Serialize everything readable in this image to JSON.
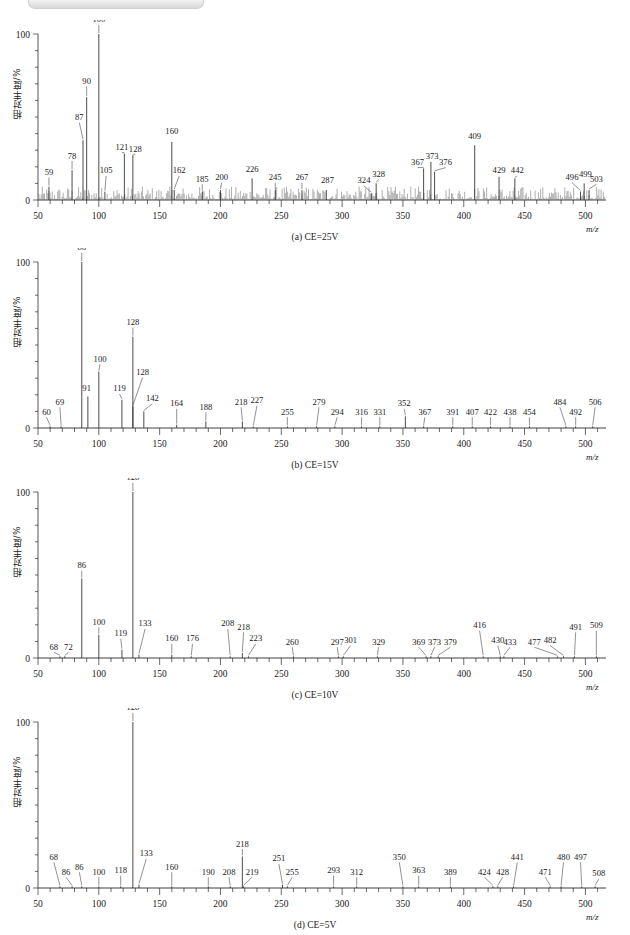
{
  "figure": {
    "title_bar_present": true,
    "axis": {
      "x_min": 50,
      "x_max": 512,
      "y_min": 0,
      "y_max": 100,
      "x_ticks_major": [
        50,
        100,
        150,
        200,
        250,
        300,
        350,
        400,
        450,
        500
      ],
      "y_ticks_major": [
        0,
        100
      ],
      "xlabel": "m/z",
      "ylabel": "相对丰度/%"
    },
    "y_axis_label": "相对丰度/%",
    "x_axis_label": "m/z",
    "y_tick_top": "100",
    "y_tick_bottom": "0"
  },
  "chart_data": [
    {
      "type": "line",
      "id": "panel-a",
      "title": "(a) CE=25V",
      "caption": "(a) CE=25V",
      "xlabel": "m/z",
      "ylabel": "相对丰度/%",
      "xlim": [
        50,
        512
      ],
      "ylim": [
        0,
        100
      ],
      "grid": false,
      "noisy_baseline": true,
      "x_ticks": [
        50,
        100,
        150,
        200,
        250,
        300,
        350,
        400,
        450,
        500
      ],
      "labeled_peaks": [
        {
          "mz": 59,
          "label": "59",
          "intensity": 8,
          "lx": 59,
          "ly": 15
        },
        {
          "mz": 78,
          "label": "78",
          "intensity": 18,
          "lx": 78,
          "ly": 25
        },
        {
          "mz": 87,
          "label": "87",
          "intensity": 36,
          "lx": 84,
          "ly": 48
        },
        {
          "mz": 90,
          "label": "90",
          "intensity": 62,
          "lx": 90,
          "ly": 70
        },
        {
          "mz": 100,
          "label": "100",
          "intensity": 100,
          "lx": 100,
          "ly": 107
        },
        {
          "mz": 105,
          "label": "105",
          "intensity": 5,
          "lx": 106,
          "ly": 16
        },
        {
          "mz": 121,
          "label": "121",
          "intensity": 28,
          "lx": 119,
          "ly": 30
        },
        {
          "mz": 128,
          "label": "128",
          "intensity": 27,
          "lx": 130,
          "ly": 29
        },
        {
          "mz": 160,
          "label": "160",
          "intensity": 35,
          "lx": 160,
          "ly": 40
        },
        {
          "mz": 162,
          "label": "162",
          "intensity": 6,
          "lx": 166,
          "ly": 16
        },
        {
          "mz": 185,
          "label": "185",
          "intensity": 5,
          "lx": 185,
          "ly": 11
        },
        {
          "mz": 200,
          "label": "200",
          "intensity": 6,
          "lx": 201,
          "ly": 12
        },
        {
          "mz": 226,
          "label": "226",
          "intensity": 13,
          "lx": 226,
          "ly": 17
        },
        {
          "mz": 245,
          "label": "245",
          "intensity": 6,
          "lx": 245,
          "ly": 12
        },
        {
          "mz": 267,
          "label": "267",
          "intensity": 6,
          "lx": 267,
          "ly": 12
        },
        {
          "mz": 287,
          "label": "287",
          "intensity": 6,
          "lx": 288,
          "ly": 10
        },
        {
          "mz": 324,
          "label": "324",
          "intensity": 4,
          "lx": 318,
          "ly": 10
        },
        {
          "mz": 328,
          "label": "328",
          "intensity": 10,
          "lx": 330,
          "ly": 14
        },
        {
          "mz": 367,
          "label": "367",
          "intensity": 19,
          "lx": 362,
          "ly": 21
        },
        {
          "mz": 373,
          "label": "373",
          "intensity": 23,
          "lx": 374,
          "ly": 25
        },
        {
          "mz": 376,
          "label": "376",
          "intensity": 17,
          "lx": 385,
          "ly": 21
        },
        {
          "mz": 409,
          "label": "409",
          "intensity": 33,
          "lx": 409,
          "ly": 37
        },
        {
          "mz": 429,
          "label": "429",
          "intensity": 14,
          "lx": 429,
          "ly": 16
        },
        {
          "mz": 442,
          "label": "442",
          "intensity": 13,
          "lx": 444,
          "ly": 16
        },
        {
          "mz": 496,
          "label": "496",
          "intensity": 5,
          "lx": 489,
          "ly": 12
        },
        {
          "mz": 499,
          "label": "499",
          "intensity": 10,
          "lx": 500,
          "ly": 14
        },
        {
          "mz": 503,
          "label": "503",
          "intensity": 6,
          "lx": 509,
          "ly": 11
        }
      ]
    },
    {
      "type": "line",
      "id": "panel-b",
      "title": "(b) CE=15V",
      "caption": "(b) CE=15V",
      "xlabel": "m/z",
      "ylabel": "相对丰度/%",
      "xlim": [
        50,
        512
      ],
      "ylim": [
        0,
        100
      ],
      "grid": false,
      "noisy_baseline": false,
      "x_ticks": [
        50,
        100,
        150,
        200,
        250,
        300,
        350,
        400,
        450,
        500
      ],
      "labeled_peaks": [
        {
          "mz": 60,
          "label": "60",
          "intensity": 1,
          "lx": 57,
          "ly": 8
        },
        {
          "mz": 69,
          "label": "69",
          "intensity": 1,
          "lx": 68,
          "ly": 14
        },
        {
          "mz": 86,
          "label": "86",
          "intensity": 100,
          "lx": 86,
          "ly": 107
        },
        {
          "mz": 91,
          "label": "91",
          "intensity": 19,
          "lx": 90,
          "ly": 22
        },
        {
          "mz": 100,
          "label": "100",
          "intensity": 34,
          "lx": 101,
          "ly": 40
        },
        {
          "mz": 119,
          "label": "119",
          "intensity": 17,
          "lx": 117,
          "ly": 22
        },
        {
          "mz": 128,
          "label": "128",
          "intensity": 55,
          "lx": 128,
          "ly": 62
        },
        {
          "mz": 128,
          "label": "128",
          "intensity": 13,
          "lx": 136,
          "ly": 32
        },
        {
          "mz": 137,
          "label": "142",
          "intensity": 10,
          "lx": 144,
          "ly": 16
        },
        {
          "mz": 164,
          "label": "164",
          "intensity": 2,
          "lx": 164,
          "ly": 13
        },
        {
          "mz": 188,
          "label": "188",
          "intensity": 4,
          "lx": 188,
          "ly": 11
        },
        {
          "mz": 218,
          "label": "218",
          "intensity": 4,
          "lx": 217,
          "ly": 14
        },
        {
          "mz": 227,
          "label": "227",
          "intensity": 1,
          "lx": 230,
          "ly": 15
        },
        {
          "mz": 255,
          "label": "255",
          "intensity": 1,
          "lx": 255,
          "ly": 8
        },
        {
          "mz": 279,
          "label": "279",
          "intensity": 1,
          "lx": 281,
          "ly": 14
        },
        {
          "mz": 294,
          "label": "294",
          "intensity": 1,
          "lx": 296,
          "ly": 8
        },
        {
          "mz": 316,
          "label": "316",
          "intensity": 1,
          "lx": 316,
          "ly": 8
        },
        {
          "mz": 331,
          "label": "331",
          "intensity": 1,
          "lx": 331,
          "ly": 8
        },
        {
          "mz": 352,
          "label": "352",
          "intensity": 7,
          "lx": 351,
          "ly": 13
        },
        {
          "mz": 367,
          "label": "367",
          "intensity": 1,
          "lx": 368,
          "ly": 8
        },
        {
          "mz": 391,
          "label": "391",
          "intensity": 1,
          "lx": 391,
          "ly": 8
        },
        {
          "mz": 407,
          "label": "407",
          "intensity": 1,
          "lx": 407,
          "ly": 8
        },
        {
          "mz": 422,
          "label": "422",
          "intensity": 1,
          "lx": 422,
          "ly": 8
        },
        {
          "mz": 438,
          "label": "438",
          "intensity": 1,
          "lx": 438,
          "ly": 8
        },
        {
          "mz": 454,
          "label": "454",
          "intensity": 1,
          "lx": 454,
          "ly": 8
        },
        {
          "mz": 484,
          "label": "484",
          "intensity": 1,
          "lx": 479,
          "ly": 14
        },
        {
          "mz": 492,
          "label": "492",
          "intensity": 1,
          "lx": 492,
          "ly": 8
        },
        {
          "mz": 506,
          "label": "506",
          "intensity": 1,
          "lx": 508,
          "ly": 14
        }
      ]
    },
    {
      "type": "line",
      "id": "panel-c",
      "title": "(c) CE=10V",
      "caption": "(c) CE=10V",
      "xlabel": "m/z",
      "ylabel": "相对丰度/%",
      "xlim": [
        50,
        512
      ],
      "ylim": [
        0,
        100
      ],
      "grid": false,
      "noisy_baseline": false,
      "x_ticks": [
        50,
        100,
        150,
        200,
        250,
        300,
        350,
        400,
        450,
        500
      ],
      "labeled_peaks": [
        {
          "mz": 68,
          "label": "68",
          "intensity": 1,
          "lx": 63,
          "ly": 5
        },
        {
          "mz": 72,
          "label": "72",
          "intensity": 1,
          "lx": 75,
          "ly": 5
        },
        {
          "mz": 86,
          "label": "86",
          "intensity": 48,
          "lx": 86,
          "ly": 54
        },
        {
          "mz": 100,
          "label": "100",
          "intensity": 14,
          "lx": 100,
          "ly": 20
        },
        {
          "mz": 119,
          "label": "119",
          "intensity": 5,
          "lx": 118,
          "ly": 13
        },
        {
          "mz": 128,
          "label": "128",
          "intensity": 100,
          "lx": 128,
          "ly": 107
        },
        {
          "mz": 133,
          "label": "133",
          "intensity": 2,
          "lx": 138,
          "ly": 19
        },
        {
          "mz": 160,
          "label": "160",
          "intensity": 2,
          "lx": 160,
          "ly": 10
        },
        {
          "mz": 176,
          "label": "176",
          "intensity": 1,
          "lx": 177,
          "ly": 10
        },
        {
          "mz": 208,
          "label": "208",
          "intensity": 1,
          "lx": 206,
          "ly": 19
        },
        {
          "mz": 218,
          "label": "218",
          "intensity": 3,
          "lx": 219,
          "ly": 17
        },
        {
          "mz": 223,
          "label": "223",
          "intensity": 1,
          "lx": 229,
          "ly": 10
        },
        {
          "mz": 260,
          "label": "260",
          "intensity": 1,
          "lx": 259,
          "ly": 8
        },
        {
          "mz": 297,
          "label": "297",
          "intensity": 1,
          "lx": 296,
          "ly": 8
        },
        {
          "mz": 301,
          "label": "301",
          "intensity": 1,
          "lx": 307,
          "ly": 9
        },
        {
          "mz": 329,
          "label": "329",
          "intensity": 1,
          "lx": 330,
          "ly": 8
        },
        {
          "mz": 369,
          "label": "369",
          "intensity": 1,
          "lx": 363,
          "ly": 8
        },
        {
          "mz": 373,
          "label": "373",
          "intensity": 1,
          "lx": 376,
          "ly": 8
        },
        {
          "mz": 379,
          "label": "379",
          "intensity": 1,
          "lx": 389,
          "ly": 8
        },
        {
          "mz": 416,
          "label": "416",
          "intensity": 1,
          "lx": 413,
          "ly": 18
        },
        {
          "mz": 430,
          "label": "430",
          "intensity": 1,
          "lx": 428,
          "ly": 9
        },
        {
          "mz": 433,
          "label": "433",
          "intensity": 1,
          "lx": 438,
          "ly": 8
        },
        {
          "mz": 477,
          "label": "477",
          "intensity": 1,
          "lx": 458,
          "ly": 8
        },
        {
          "mz": 482,
          "label": "482",
          "intensity": 1,
          "lx": 471,
          "ly": 9
        },
        {
          "mz": 491,
          "label": "491",
          "intensity": 1,
          "lx": 492,
          "ly": 17
        },
        {
          "mz": 509,
          "label": "509",
          "intensity": 1,
          "lx": 509,
          "ly": 18
        }
      ]
    },
    {
      "type": "line",
      "id": "panel-d",
      "title": "(d) CE=5V",
      "caption": "(d) CE=5V",
      "xlabel": "m/z",
      "ylabel": "相对丰度/%",
      "xlim": [
        50,
        512
      ],
      "ylim": [
        0,
        100
      ],
      "grid": false,
      "noisy_baseline": false,
      "x_ticks": [
        50,
        100,
        150,
        200,
        250,
        300,
        350,
        400,
        450,
        500
      ],
      "labeled_peaks": [
        {
          "mz": 68,
          "label": "68",
          "intensity": 1,
          "lx": 63,
          "ly": 17
        },
        {
          "mz": 78,
          "label": "86",
          "intensity": 1,
          "lx": 73,
          "ly": 8
        },
        {
          "mz": 86,
          "label": "86",
          "intensity": 1,
          "lx": 84,
          "ly": 11
        },
        {
          "mz": 100,
          "label": "100",
          "intensity": 1,
          "lx": 100,
          "ly": 8
        },
        {
          "mz": 118,
          "label": "118",
          "intensity": 1,
          "lx": 118,
          "ly": 9
        },
        {
          "mz": 128,
          "label": "128",
          "intensity": 100,
          "lx": 128,
          "ly": 107
        },
        {
          "mz": 133,
          "label": "133",
          "intensity": 2,
          "lx": 139,
          "ly": 19
        },
        {
          "mz": 160,
          "label": "160",
          "intensity": 1,
          "lx": 160,
          "ly": 11
        },
        {
          "mz": 190,
          "label": "190",
          "intensity": 1,
          "lx": 190,
          "ly": 8
        },
        {
          "mz": 208,
          "label": "208",
          "intensity": 1,
          "lx": 207,
          "ly": 8
        },
        {
          "mz": 218,
          "label": "218",
          "intensity": 19,
          "lx": 218,
          "ly": 25
        },
        {
          "mz": 219,
          "label": "219",
          "intensity": 1,
          "lx": 226,
          "ly": 8
        },
        {
          "mz": 251,
          "label": "251",
          "intensity": 2,
          "lx": 248,
          "ly": 16
        },
        {
          "mz": 255,
          "label": "255",
          "intensity": 1,
          "lx": 259,
          "ly": 8
        },
        {
          "mz": 293,
          "label": "293",
          "intensity": 1,
          "lx": 293,
          "ly": 9
        },
        {
          "mz": 312,
          "label": "312",
          "intensity": 1,
          "lx": 312,
          "ly": 8
        },
        {
          "mz": 350,
          "label": "350",
          "intensity": 1,
          "lx": 347,
          "ly": 17
        },
        {
          "mz": 363,
          "label": "363",
          "intensity": 1,
          "lx": 363,
          "ly": 9
        },
        {
          "mz": 389,
          "label": "389",
          "intensity": 1,
          "lx": 389,
          "ly": 8
        },
        {
          "mz": 424,
          "label": "424",
          "intensity": 1,
          "lx": 417,
          "ly": 8
        },
        {
          "mz": 428,
          "label": "428",
          "intensity": 1,
          "lx": 432,
          "ly": 8
        },
        {
          "mz": 441,
          "label": "441",
          "intensity": 1,
          "lx": 444,
          "ly": 17
        },
        {
          "mz": 471,
          "label": "471",
          "intensity": 1,
          "lx": 467,
          "ly": 8
        },
        {
          "mz": 480,
          "label": "480",
          "intensity": 1,
          "lx": 482,
          "ly": 17
        },
        {
          "mz": 497,
          "label": "497",
          "intensity": 1,
          "lx": 496,
          "ly": 17
        },
        {
          "mz": 508,
          "label": "508",
          "intensity": 1,
          "lx": 511,
          "ly": 7
        }
      ]
    }
  ]
}
